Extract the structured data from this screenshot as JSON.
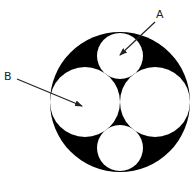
{
  "diagram": {
    "colors": {
      "background": "#ffffff",
      "fill": "#000000",
      "circles": "#ffffff",
      "arrow": "#222222"
    },
    "outer_circle": {
      "cx": 120,
      "cy": 102,
      "r": 70
    },
    "inner_circles": [
      {
        "id": "top",
        "cx": 120,
        "cy": 56,
        "r": 23
      },
      {
        "id": "left",
        "cx": 85,
        "cy": 102,
        "r": 35
      },
      {
        "id": "right",
        "cx": 155,
        "cy": 102,
        "r": 35
      },
      {
        "id": "bottom",
        "cx": 120,
        "cy": 148,
        "r": 23
      }
    ],
    "labels": [
      {
        "id": "A",
        "text": "A",
        "x": 156,
        "y": 18,
        "arrow": {
          "x1": 155,
          "y1": 22,
          "x2": 120,
          "y2": 55
        }
      },
      {
        "id": "B",
        "text": "B",
        "x": 4,
        "y": 80,
        "arrow": {
          "x1": 17,
          "y1": 79,
          "x2": 82,
          "y2": 106
        }
      }
    ]
  }
}
